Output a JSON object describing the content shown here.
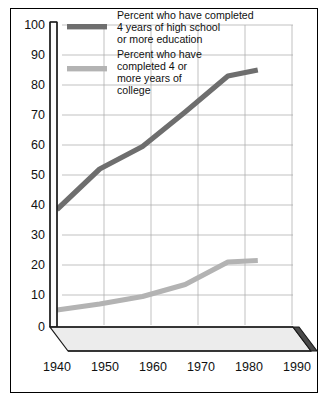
{
  "chart_data": {
    "type": "line",
    "title": "",
    "subtitle": "",
    "xlabel": "",
    "ylabel": "",
    "x": [
      1940,
      1950,
      1960,
      1970,
      1980,
      1987
    ],
    "categories": [
      "1940",
      "1950",
      "1960",
      "1970",
      "1980",
      "1990"
    ],
    "xlim": [
      1940,
      1995
    ],
    "ylim": [
      0,
      100
    ],
    "y_ticks": [
      0,
      10,
      20,
      30,
      40,
      50,
      60,
      70,
      80,
      90,
      100
    ],
    "y_tick_labels": [
      "0",
      "10",
      "20",
      "30",
      "40",
      "50",
      "60",
      "70",
      "80",
      "90",
      "100"
    ],
    "x_ticks": [
      1940,
      1950,
      1960,
      1970,
      1980,
      1990
    ],
    "x_tick_labels": [
      "1940",
      "1950",
      "1960",
      "1970",
      "1980",
      "1990"
    ],
    "grid": true,
    "legend_position": "top-center",
    "series": [
      {
        "name": "Percent who have completed 4 years of high school or more education",
        "label_lines": [
          "Percent who have completed",
          "4 years of high school",
          "or more education"
        ],
        "color": "#6e6e6e",
        "x": [
          1940,
          1950,
          1960,
          1970,
          1980,
          1987
        ],
        "values": [
          38.5,
          52,
          59.5,
          71,
          83,
          85
        ]
      },
      {
        "name": "Percent who have completed 4 or more years of college",
        "label_lines": [
          "Percent who have",
          "completed 4 or",
          "more years of",
          "college"
        ],
        "color": "#b3b3b3",
        "x": [
          1940,
          1950,
          1960,
          1970,
          1980,
          1987
        ],
        "values": [
          5,
          7,
          9.5,
          13.5,
          21,
          21.5
        ]
      }
    ]
  },
  "axis": {
    "y_labels": [
      "100",
      "90",
      "80",
      "70",
      "60",
      "50",
      "40",
      "30",
      "20",
      "10",
      "0"
    ],
    "x_labels": [
      "1940",
      "1950",
      "1960",
      "1970",
      "1980",
      "1990"
    ]
  },
  "legend": {
    "entries": [
      {
        "swatch_color": "#6e6e6e",
        "line1": "Percent who have completed",
        "line2": "4 years of high school",
        "line3": "or more education",
        "line4": ""
      },
      {
        "swatch_color": "#b3b3b3",
        "line1": "Percent who have",
        "line2": "completed 4 or",
        "line3": "more years of",
        "line4": "college"
      }
    ]
  }
}
